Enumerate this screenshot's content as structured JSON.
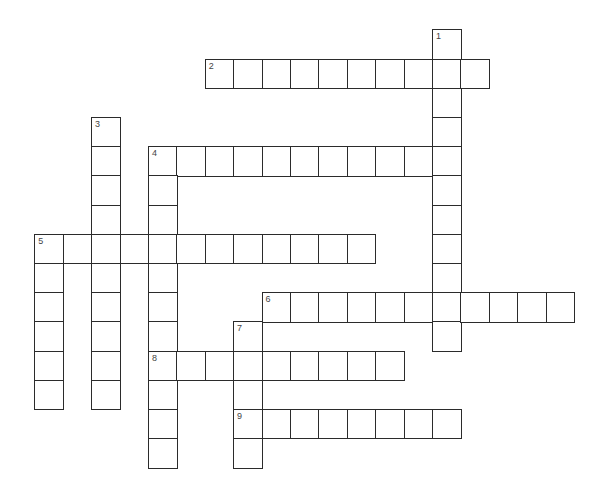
{
  "puzzle": {
    "type": "crossword",
    "layout": {
      "origin_x": 35,
      "origin_y": 30,
      "pitch_x": 28.4,
      "pitch_y": 29.2
    },
    "colors": {
      "line": "#2b2b2b",
      "number": "#444444",
      "cell": "#ffffff"
    },
    "entries": [
      {
        "number": "1",
        "direction": "down",
        "row": 0,
        "col": 14,
        "length": 11
      },
      {
        "number": "2",
        "direction": "across",
        "row": 1,
        "col": 6,
        "length": 10
      },
      {
        "number": "3",
        "direction": "down",
        "row": 3,
        "col": 2,
        "length": 10
      },
      {
        "number": "4",
        "direction": "across",
        "row": 4,
        "col": 4,
        "length": 11
      },
      {
        "number": "4",
        "direction": "down",
        "row": 4,
        "col": 4,
        "length": 11
      },
      {
        "number": "5",
        "direction": "across",
        "row": 7,
        "col": 0,
        "length": 12
      },
      {
        "number": "5",
        "direction": "down",
        "row": 7,
        "col": 0,
        "length": 6
      },
      {
        "number": "6",
        "direction": "across",
        "row": 9,
        "col": 8,
        "length": 11
      },
      {
        "number": "7",
        "direction": "down",
        "row": 10,
        "col": 7,
        "length": 5
      },
      {
        "number": "8",
        "direction": "across",
        "row": 11,
        "col": 4,
        "length": 9
      },
      {
        "number": "9",
        "direction": "across",
        "row": 13,
        "col": 7,
        "length": 8
      }
    ]
  }
}
